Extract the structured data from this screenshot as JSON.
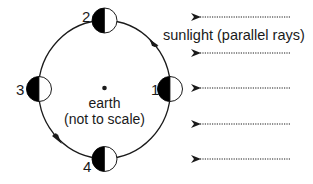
{
  "diagram": {
    "earth": {
      "label_line1": "earth",
      "label_line2": "(not to scale)"
    },
    "sunlight": {
      "label": "sunlight (parallel rays)",
      "direction": "right-to-left",
      "ray_count": 5
    },
    "orbit": {
      "direction": "counterclockwise"
    },
    "moons": [
      {
        "label": "1",
        "position": "right",
        "dark_side": "left",
        "lit_side": "right"
      },
      {
        "label": "2",
        "position": "top",
        "dark_side": "left",
        "lit_side": "right"
      },
      {
        "label": "3",
        "position": "left",
        "dark_side": "left",
        "lit_side": "right"
      },
      {
        "label": "4",
        "position": "bottom",
        "dark_side": "left",
        "lit_side": "right"
      }
    ],
    "colors": {
      "line": "#1a1a1a",
      "dark_half": "#000000",
      "lit_half": "#ffffff",
      "background": "#ffffff"
    }
  }
}
